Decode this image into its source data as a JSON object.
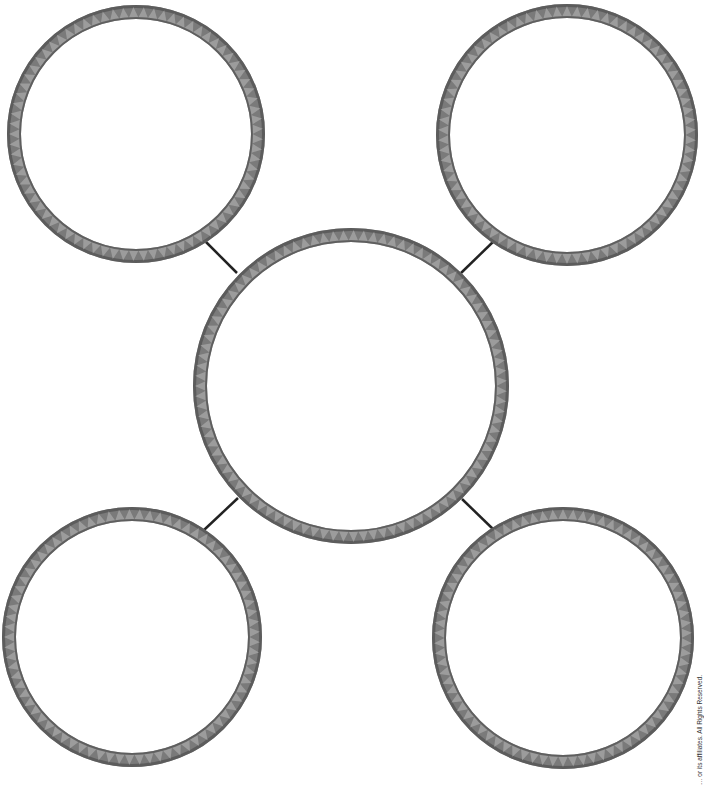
{
  "diagram": {
    "type": "web-graphic-organizer",
    "ring_color": "#7a7a7a",
    "ring_dark": "#555555",
    "ring_light": "#b8b8b8",
    "connector_color": "#222222",
    "background": "#ffffff",
    "center": {
      "name": "center",
      "cx": 351,
      "cy": 386,
      "r": 151,
      "label": ""
    },
    "nodes": [
      {
        "name": "top-left",
        "cx": 136,
        "cy": 134,
        "r": 122,
        "label": ""
      },
      {
        "name": "top-right",
        "cx": 567,
        "cy": 135,
        "r": 124,
        "label": ""
      },
      {
        "name": "bottom-left",
        "cx": 132,
        "cy": 637,
        "r": 123,
        "label": ""
      },
      {
        "name": "bottom-right",
        "cx": 563,
        "cy": 638,
        "r": 124,
        "label": ""
      }
    ],
    "connectors": [
      {
        "name": "center-to-top-left",
        "x1": 204,
        "y1": 240,
        "x2": 237,
        "y2": 273
      },
      {
        "name": "center-to-top-right",
        "x1": 495,
        "y1": 240,
        "x2": 461,
        "y2": 273
      },
      {
        "name": "center-to-bottom-left",
        "x1": 238,
        "y1": 498,
        "x2": 204,
        "y2": 530
      },
      {
        "name": "center-to-bottom-right",
        "x1": 462,
        "y1": 499,
        "x2": 494,
        "y2": 530
      }
    ]
  },
  "footer": {
    "copyright": "… or its affiliates. All Rights Reserved."
  }
}
